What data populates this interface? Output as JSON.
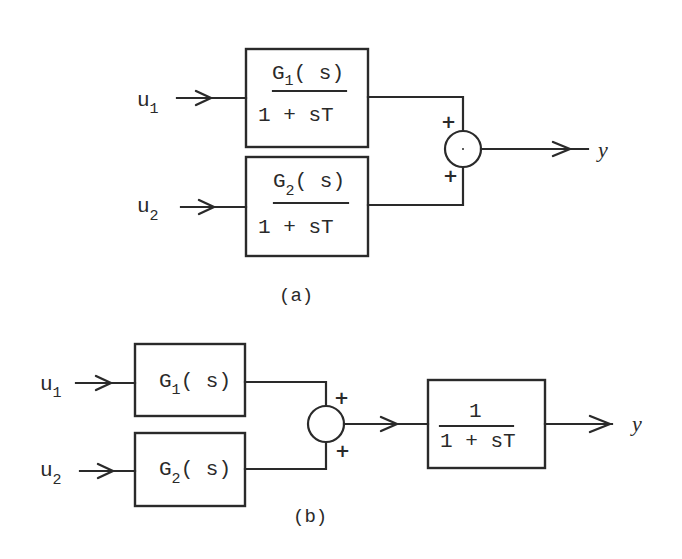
{
  "diagram_a": {
    "caption": "(a)",
    "inputs": [
      {
        "symbol": "u",
        "subscript": "1"
      },
      {
        "symbol": "u",
        "subscript": "2"
      }
    ],
    "blocks": [
      {
        "numerator_main": "G",
        "numerator_sub": "1",
        "numerator_tail": "( s)",
        "denominator": "1 + sT"
      },
      {
        "numerator_main": "G",
        "numerator_sub": "2",
        "numerator_tail": "( s)",
        "denominator": "1 + sT"
      }
    ],
    "junction": {
      "top_sign": "+",
      "bottom_sign": "+"
    },
    "output": "y"
  },
  "diagram_b": {
    "caption": "(b)",
    "inputs": [
      {
        "symbol": "u",
        "subscript": "1"
      },
      {
        "symbol": "u",
        "subscript": "2"
      }
    ],
    "blocks": [
      {
        "main": "G",
        "sub": "1",
        "tail": "( s)"
      },
      {
        "main": "G",
        "sub": "2",
        "tail": "( s)"
      }
    ],
    "junction": {
      "top_sign": "+",
      "bottom_sign": "+"
    },
    "output_block": {
      "numerator": "1",
      "denominator": "1 + sT"
    },
    "output": "y"
  }
}
